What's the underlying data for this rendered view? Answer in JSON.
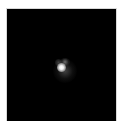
{
  "image": {
    "description": "Astronomical cutout showing a single compact bright source on a black sky background",
    "background_color": "#000000",
    "border_color": "#ffffff",
    "source": {
      "center_px": [
        60,
        66
      ],
      "color": "#ffffff",
      "features": [
        "bright-core",
        "faint-lobe-upper-right",
        "faint-extension-upper-left"
      ]
    }
  }
}
